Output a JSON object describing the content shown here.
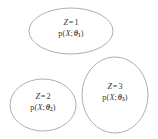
{
  "figure": {
    "type": "diagram",
    "title": "",
    "background_color": "#ffffff",
    "stroke_color": "#9a9a9a",
    "text_color": "#3a3a3a"
  },
  "clusters": [
    {
      "id": "cluster-1",
      "z_variable": "Z",
      "z_equals": "=",
      "z_value": "1",
      "z_label": "Z = 1",
      "density_fn": "p",
      "density_open": "(",
      "density_var": "X",
      "density_sep": ";",
      "density_param": "θ",
      "density_index": "1",
      "density_close": ")",
      "density_label": "p(X; θ₁)",
      "shape": "ellipse",
      "cx": 71,
      "cy": 31,
      "rx": 42,
      "ry": 23
    },
    {
      "id": "cluster-2",
      "z_variable": "Z",
      "z_equals": "=",
      "z_value": "2",
      "z_label": "Z = 2",
      "density_fn": "p",
      "density_open": "(",
      "density_var": "X",
      "density_sep": ";",
      "density_param": "θ",
      "density_index": "2",
      "density_close": ")",
      "density_label": "p(X; θ₂)",
      "shape": "ellipse",
      "cx": 43,
      "cy": 105,
      "rx": 33,
      "ry": 26
    },
    {
      "id": "cluster-3",
      "z_variable": "Z",
      "z_equals": "=",
      "z_value": "3",
      "z_label": "Z = 3",
      "density_fn": "p",
      "density_open": "(",
      "density_var": "X",
      "density_sep": ";",
      "density_param": "θ",
      "density_index": "3",
      "density_close": ")",
      "density_label": "p(X; θ₃)",
      "shape": "ellipse",
      "cx": 115,
      "cy": 95,
      "rx": 33,
      "ry": 38
    }
  ]
}
